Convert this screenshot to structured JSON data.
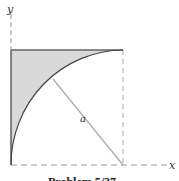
{
  "figure": {
    "axis_x_label": "x",
    "axis_y_label": "y",
    "radius_label": "a",
    "caption": "Problem 5/37",
    "colors": {
      "shade": "#d9d9d9",
      "line": "#555555",
      "dash": "#9a9a9a",
      "radius_line": "#aaaaaa"
    }
  }
}
